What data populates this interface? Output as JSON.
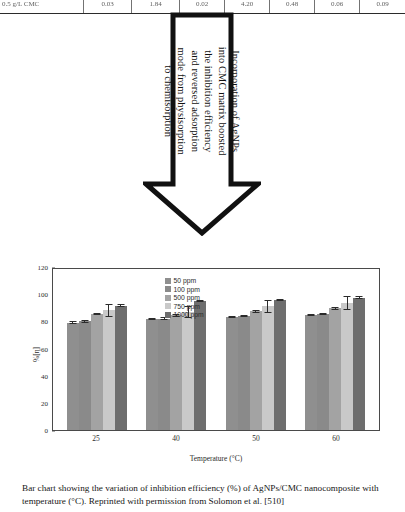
{
  "table_strip": {
    "cells": [
      "0.5 g/L CMC",
      "0.03",
      "1.84",
      "0.02",
      "4.20",
      "0.48",
      "0.06",
      "0.09"
    ]
  },
  "callout": {
    "text": "Incorporation of AgNPs into CMC matrix boosted the inhibition efficiency and reversed adsorption mode from physisorption to chemisorption",
    "shape": "down-arrow",
    "border_color": "#111111",
    "fill_color": "#ffffff"
  },
  "chart_data": {
    "type": "bar",
    "title": "",
    "categories": [
      "25",
      "40",
      "50",
      "60"
    ],
    "xlabel": "Temperature (°C)",
    "ylabel": "%[η]",
    "ylim": [
      0,
      120
    ],
    "yticks": [
      0,
      20,
      40,
      60,
      80,
      100,
      120
    ],
    "grid": false,
    "legend_position": "top-center",
    "series": [
      {
        "name": "50 ppm",
        "color": "#8f8f8f",
        "values": [
          79.0,
          81.5,
          83.0,
          84.5
        ],
        "errors": [
          1.0,
          0.8,
          0.9,
          0.8
        ]
      },
      {
        "name": "100 ppm",
        "color": "#8a8a8a",
        "values": [
          80.0,
          82.0,
          84.0,
          85.5
        ],
        "errors": [
          1.0,
          0.9,
          1.0,
          0.9
        ]
      },
      {
        "name": "500 ppm",
        "color": "#a3a3a3",
        "values": [
          85.5,
          84.5,
          87.5,
          89.5
        ],
        "errors": [
          1.0,
          1.0,
          1.2,
          1.0
        ]
      },
      {
        "name": "750 ppm",
        "color": "#c9c9c9",
        "values": [
          88.0,
          87.0,
          91.0,
          93.5
        ],
        "errors": [
          4.5,
          4.5,
          4.5,
          5.0
        ]
      },
      {
        "name": "1000 ppm",
        "color": "#6e6e6e",
        "values": [
          91.5,
          95.0,
          95.5,
          97.5
        ],
        "errors": [
          1.0,
          0.8,
          0.8,
          0.8
        ]
      }
    ]
  },
  "caption": {
    "text": "Bar chart showing the variation of inhibition efficiency (%) of AgNPs/CMC nanocomposite with temperature (°C). Reprinted with permission from Solomon et al. [510]"
  }
}
